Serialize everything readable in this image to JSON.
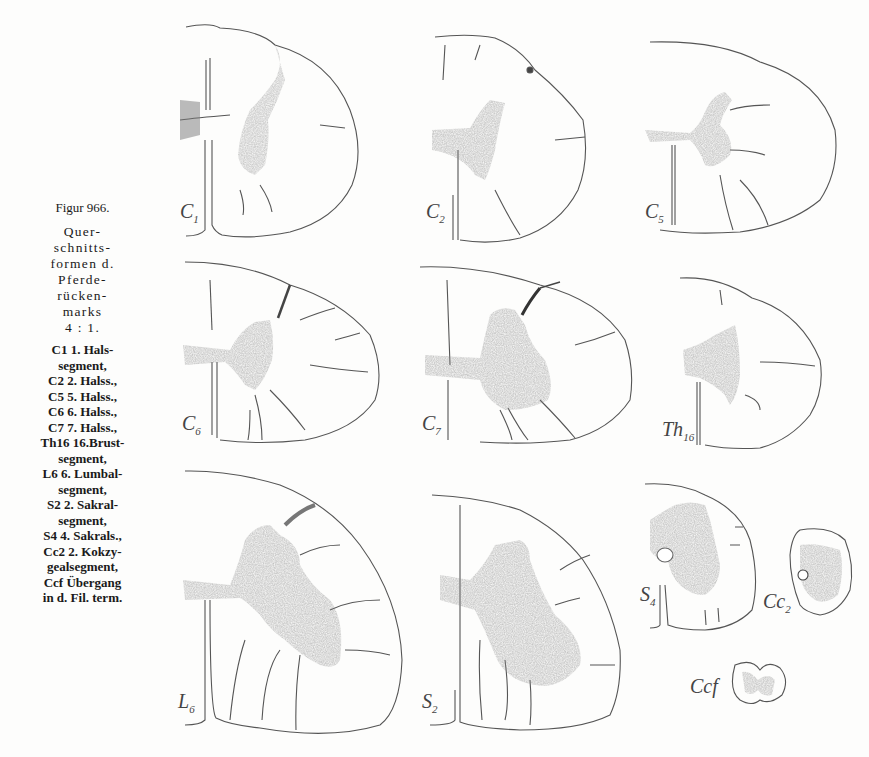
{
  "caption": {
    "figure_number": "Figur 966.",
    "description_lines": [
      "Quer-",
      "schnitts-",
      "formen d.",
      "Pferde-",
      "rücken-",
      "marks",
      "4 : 1."
    ],
    "legend": [
      {
        "abbr": "C1",
        "text": "1. Hals-",
        "cont": "segment,"
      },
      {
        "abbr": "C2",
        "text": "2. Halss.,",
        "cont": ""
      },
      {
        "abbr": "C5",
        "text": "5. Halss.,",
        "cont": ""
      },
      {
        "abbr": "C6",
        "text": "6. Halss.,",
        "cont": ""
      },
      {
        "abbr": "C7",
        "text": "7. Halss.,",
        "cont": ""
      },
      {
        "abbr": "Th16",
        "text": "16.Brust-",
        "cont": "segment,"
      },
      {
        "abbr": "L6",
        "text": "6. Lumbal-",
        "cont": "segment,"
      },
      {
        "abbr": "S2",
        "text": "2. Sakral-",
        "cont": "segment,"
      },
      {
        "abbr": "S4",
        "text": "4. Sakrals.,",
        "cont": ""
      },
      {
        "abbr": "Cc2",
        "text": "2. Kokzy-",
        "cont": "gealsegment,"
      },
      {
        "abbr": "Ccf",
        "text": "Übergang",
        "cont": "in d. Fil. term."
      }
    ]
  },
  "sections": [
    {
      "id": "C1",
      "label": "C",
      "sub": "1"
    },
    {
      "id": "C2",
      "label": "C",
      "sub": "2"
    },
    {
      "id": "C5",
      "label": "C",
      "sub": "5"
    },
    {
      "id": "C6",
      "label": "C",
      "sub": "6"
    },
    {
      "id": "C7",
      "label": "C",
      "sub": "7"
    },
    {
      "id": "Th16",
      "label": "Th",
      "sub": "16"
    },
    {
      "id": "L6",
      "label": "L",
      "sub": "6"
    },
    {
      "id": "S2",
      "label": "S",
      "sub": "2"
    },
    {
      "id": "S4",
      "label": "S",
      "sub": "4"
    },
    {
      "id": "Cc2",
      "label": "Cc",
      "sub": "2"
    },
    {
      "id": "Ccf",
      "label": "Ccf",
      "sub": ""
    }
  ],
  "colors": {
    "ink": "#3a3a3a",
    "grey_matter": "#5a5a5a",
    "paper": "#fdfdfc"
  }
}
